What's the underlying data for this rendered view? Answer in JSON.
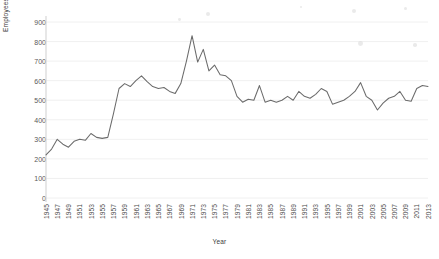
{
  "chart_data": {
    "type": "line",
    "title": "",
    "xlabel": "Year",
    "ylabel": "Employees",
    "ylim": [
      0,
      900
    ],
    "ytick_step": 100,
    "yticks": [
      0,
      100,
      200,
      300,
      400,
      500,
      600,
      700,
      800,
      900
    ],
    "xtick_labels": [
      "1945",
      "1947",
      "1949",
      "1951",
      "1953",
      "1955",
      "1957",
      "1959",
      "1961",
      "1963",
      "1965",
      "1967",
      "1969",
      "1971",
      "1973",
      "1975",
      "1977",
      "1979",
      "1981",
      "1983",
      "1985",
      "1987",
      "1989",
      "1991",
      "1993",
      "1995",
      "1997",
      "1999",
      "2001",
      "2003",
      "2005",
      "2007",
      "2009",
      "2011",
      "2013"
    ],
    "xlim": [
      1945,
      2013
    ],
    "grid": true,
    "legend": "none",
    "line_color": "#6b6b6b",
    "grid_color": "#ececec",
    "axis_color": "#cfcfcf",
    "x": [
      1945,
      1946,
      1947,
      1948,
      1949,
      1950,
      1951,
      1952,
      1953,
      1954,
      1955,
      1956,
      1957,
      1958,
      1959,
      1960,
      1961,
      1962,
      1963,
      1964,
      1965,
      1966,
      1967,
      1968,
      1969,
      1970,
      1971,
      1972,
      1973,
      1974,
      1975,
      1976,
      1977,
      1978,
      1979,
      1980,
      1981,
      1982,
      1983,
      1984,
      1985,
      1986,
      1987,
      1988,
      1989,
      1990,
      1991,
      1992,
      1993,
      1994,
      1995,
      1996,
      1997,
      1998,
      1999,
      2000,
      2001,
      2002,
      2003,
      2004,
      2005,
      2006,
      2007,
      2008,
      2009,
      2010,
      2011,
      2012,
      2013
    ],
    "values": [
      220,
      250,
      300,
      275,
      260,
      290,
      300,
      295,
      330,
      310,
      305,
      310,
      430,
      560,
      585,
      570,
      600,
      625,
      595,
      570,
      560,
      565,
      545,
      535,
      585,
      700,
      830,
      695,
      760,
      650,
      680,
      630,
      625,
      600,
      520,
      490,
      505,
      500,
      575,
      490,
      500,
      490,
      500,
      520,
      500,
      545,
      520,
      510,
      530,
      560,
      545,
      480,
      490,
      500,
      520,
      545,
      590,
      520,
      500,
      450,
      485,
      510,
      520,
      545,
      500,
      495,
      560,
      575,
      570
    ],
    "series": [
      {
        "name": "Employees",
        "values": [
          220,
          250,
          300,
          275,
          260,
          290,
          300,
          295,
          330,
          310,
          305,
          310,
          430,
          560,
          585,
          570,
          600,
          625,
          595,
          570,
          560,
          565,
          545,
          535,
          585,
          700,
          830,
          695,
          760,
          650,
          680,
          630,
          625,
          600,
          520,
          490,
          505,
          500,
          575,
          490,
          500,
          490,
          500,
          520,
          500,
          545,
          520,
          510,
          530,
          560,
          545,
          480,
          490,
          500,
          520,
          545,
          590,
          520,
          500,
          450,
          485,
          510,
          520,
          545,
          500,
          495,
          560,
          575,
          570
        ]
      }
    ],
    "annotations": []
  },
  "specks": [
    {
      "x": 352,
      "y": 9,
      "r": 2.2
    },
    {
      "x": 404,
      "y": 7,
      "r": 1.6
    },
    {
      "x": 206,
      "y": 12,
      "r": 2.0
    },
    {
      "x": 178,
      "y": 18,
      "r": 1.4
    },
    {
      "x": 358,
      "y": 41,
      "r": 2.4
    },
    {
      "x": 413,
      "y": 43,
      "r": 1.8
    },
    {
      "x": 300,
      "y": 6,
      "r": 1.2
    }
  ]
}
